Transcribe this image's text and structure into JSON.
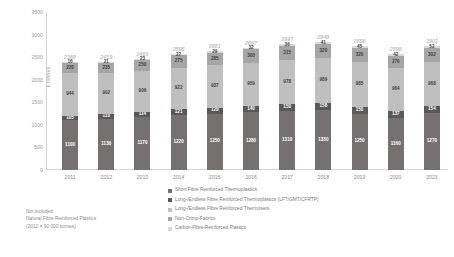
{
  "chart_data": {
    "type": "bar",
    "stacked": true,
    "title": "",
    "xlabel": "",
    "ylabel": "k tonnes",
    "ylim": [
      0,
      3500
    ],
    "ytick_step": 500,
    "yticks": [
      0,
      500,
      1000,
      1500,
      2000,
      2500,
      3000,
      3500
    ],
    "grid": false,
    "legend_position": "bottom-center",
    "categories": [
      "2011",
      "2012",
      "2013",
      "2014",
      "2015",
      "2016",
      "2017",
      "2018",
      "2019",
      "2020",
      "2021"
    ],
    "series": [
      {
        "name": "Short Fibre Reinforced Thermoplastics",
        "color": "#767171",
        "values": [
          1100,
          1130,
          1170,
          1220,
          1250,
          1280,
          1310,
          1330,
          1250,
          1160,
          1270
        ]
      },
      {
        "name": "Long-/Endless Fibre Reinforced Thermoplastics (LFT/GMT/CFRTP)",
        "color": "#595959",
        "values": [
          105,
          110,
          114,
          121,
          129,
          140,
          150,
          158,
          150,
          137,
          154
        ]
      },
      {
        "name": "Long-/Endless Fibre Reinforced Thermosets",
        "color": "#bfbfbf",
        "values": [
          944,
          902,
          906,
          922,
          937,
          959,
          978,
          989,
          985,
          964,
          968
        ]
      },
      {
        "name": "Non-Crimp-Fabrics",
        "color": "#a6a6a6",
        "values": [
          220,
          235,
          250,
          275,
          285,
          300,
          315,
          320,
          320,
          270,
          302
        ]
      },
      {
        "name": "Carbon-Fibre-Reinforced Plastics",
        "color": "#d9d9d9",
        "values": [
          16,
          21,
          23,
          27,
          29,
          32,
          36,
          41,
          45,
          42,
          52
        ]
      }
    ],
    "totals": [
      2368,
      2419,
      2493,
      2595,
      2681,
      2697,
      2697,
      2848,
      2896,
      2598,
      2902
    ],
    "segment_labels": {
      "note": "values printed inside each stacked segment, bottom to top"
    }
  },
  "legend": {
    "items": [
      {
        "label": "Short Fibre Reinforced Thermoplastics",
        "color": "#767171"
      },
      {
        "label": "Long-/Endless Fibre Reinforced Thermoplastics (LFT/GMT/CFRTP)",
        "color": "#595959"
      },
      {
        "label": "Long-/Endless Fibre Reinforced Thermosets",
        "color": "#bfbfbf"
      },
      {
        "label": "Non-Crimp-Fabrics",
        "color": "#a6a6a6"
      },
      {
        "label": "Carbon-Fibre-Reinforced Plastics",
        "color": "#d9d9d9"
      }
    ]
  },
  "footnote": {
    "line1": "Not included:",
    "line2": "Natural Fibre Reinforced Plastics",
    "line3": "(2012 = 90 000 tonnes)"
  }
}
